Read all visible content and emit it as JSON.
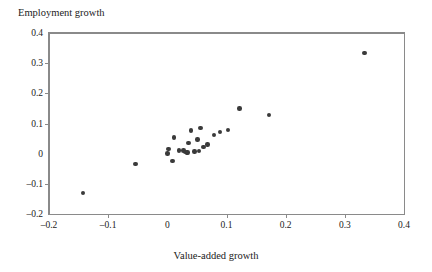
{
  "chart_data": {
    "type": "scatter",
    "title": "",
    "xlabel": "Value-added growth",
    "ylabel": "Employment growth",
    "xlim": [
      -0.2,
      0.4
    ],
    "ylim": [
      -0.2,
      0.4
    ],
    "xticks": [
      -0.2,
      -0.1,
      0,
      0.1,
      0.2,
      0.3,
      0.4
    ],
    "xtick_labels": [
      "–0.2",
      "–0.1",
      "0",
      "0.1",
      "0.2",
      "0.3",
      "0.4"
    ],
    "yticks": [
      -0.2,
      -0.1,
      0,
      0.1,
      0.2,
      0.3,
      0.4
    ],
    "ytick_labels": [
      "–0.2",
      "–0.1",
      "0",
      "0.1",
      "0.2",
      "0.3",
      "0.4"
    ],
    "grid": false,
    "legend": null,
    "marker_color": "#3a3a3a",
    "axis_color": "#8a8a8a",
    "points": [
      {
        "x": -0.143,
        "y": -0.131
      },
      {
        "x": -0.054,
        "y": -0.035
      },
      {
        "x": 0.0,
        "y": 0.0
      },
      {
        "x": 0.002,
        "y": 0.015
      },
      {
        "x": 0.009,
        "y": -0.025
      },
      {
        "x": 0.011,
        "y": 0.053
      },
      {
        "x": 0.02,
        "y": 0.01
      },
      {
        "x": 0.027,
        "y": 0.011
      },
      {
        "x": 0.031,
        "y": 0.005
      },
      {
        "x": 0.033,
        "y": 0.002
      },
      {
        "x": 0.034,
        "y": 0.004
      },
      {
        "x": 0.036,
        "y": 0.035
      },
      {
        "x": 0.04,
        "y": 0.077
      },
      {
        "x": 0.046,
        "y": 0.007
      },
      {
        "x": 0.051,
        "y": 0.047
      },
      {
        "x": 0.053,
        "y": 0.009
      },
      {
        "x": 0.056,
        "y": 0.085
      },
      {
        "x": 0.061,
        "y": 0.022
      },
      {
        "x": 0.068,
        "y": 0.03
      },
      {
        "x": 0.079,
        "y": 0.062
      },
      {
        "x": 0.089,
        "y": 0.072
      },
      {
        "x": 0.103,
        "y": 0.079
      },
      {
        "x": 0.122,
        "y": 0.15
      },
      {
        "x": 0.172,
        "y": 0.128
      },
      {
        "x": 0.333,
        "y": 0.333
      }
    ]
  }
}
